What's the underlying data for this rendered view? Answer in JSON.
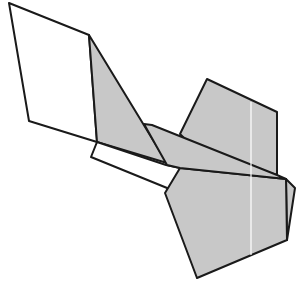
{
  "diagram": {
    "type": "folded-paper-figure",
    "colors": {
      "background": "#ffffff",
      "face_white": "#ffffff",
      "face_gray": "#c8c8c8",
      "stroke": "#1a1a1a",
      "crease": "#ffffff"
    },
    "shapes": [
      {
        "id": "white-quad",
        "fill": "face_white",
        "points": "9,3 89,35 97,142 29,121"
      },
      {
        "id": "gray-triangle",
        "fill": "face_gray",
        "points": "89,35 167,163 97,142"
      },
      {
        "id": "white-strip",
        "fill": "face_white",
        "points": "97,142 166,165 180,168 172,190 91,157"
      },
      {
        "id": "upper-right-gray",
        "fill": "face_gray",
        "points": "207,79 277,112 277,175 196,150 180,134"
      },
      {
        "id": "back-sliver",
        "fill": "face_gray",
        "points": "286,179 295,188 287,240"
      },
      {
        "id": "lower-pentagon",
        "fill": "face_gray",
        "points": "180,168 286,179 287,240 197,278 165,193"
      },
      {
        "id": "long-band",
        "fill": "face_gray",
        "points": "144,124 152,125 277,175 286,179 180,168 167,165"
      }
    ],
    "crease_line": {
      "x1": 251,
      "y1": 102,
      "x2": 251,
      "y2": 255
    }
  }
}
